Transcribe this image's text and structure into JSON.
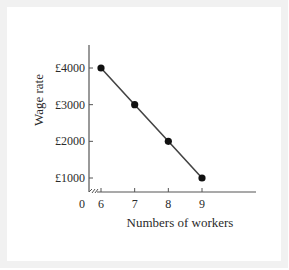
{
  "chart_data": {
    "type": "line",
    "title": "",
    "xlabel": "Numbers of workers",
    "ylabel": "Wage rate",
    "x": [
      6,
      7,
      8,
      9
    ],
    "series": [
      {
        "name": "Wage rate",
        "values": [
          4000,
          3000,
          2000,
          1000
        ]
      }
    ],
    "x_ticks": [
      "6",
      "7",
      "8",
      "9"
    ],
    "y_ticks": [
      "£1000",
      "£2000",
      "£3000",
      "£4000"
    ],
    "y_tick_values": [
      1000,
      2000,
      3000,
      4000
    ],
    "origin_label": "0",
    "x_axis_break": true,
    "xlim": [
      5.5,
      10.5
    ],
    "ylim": [
      600,
      4600
    ],
    "grid": false,
    "legend": "none",
    "line_color": "#444444",
    "marker_color": "#111111"
  }
}
